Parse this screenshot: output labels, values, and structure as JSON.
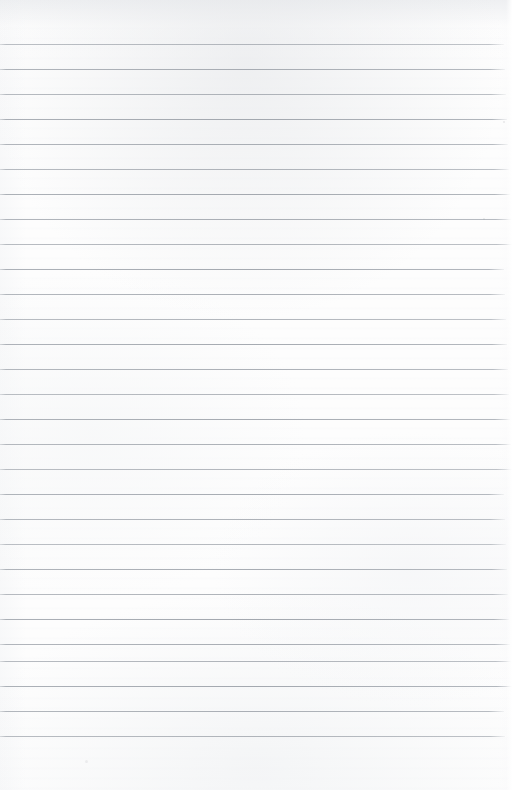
{
  "document": {
    "kind": "scanned-lined-paper",
    "title": "Blank ruled notebook page",
    "orientation": "portrait",
    "width_px": 512,
    "height_px": 790,
    "text_content": "",
    "handwriting_present": "none",
    "printed_text_present": "none"
  },
  "paper": {
    "background_color": "#fdfdfd",
    "edge_tint_color": "#e8eaed",
    "texture": "subtle scan shading, uneven illumination near top edge"
  },
  "ruling": {
    "line_color": "#a2a7ae",
    "line_thickness_px": 1,
    "line_spacing_px": 25,
    "first_line_y_px": 44,
    "last_line_y_px": 736,
    "line_count": 29,
    "left_inset_px": 0,
    "right_end_px": 508,
    "margin_rule_present": "none",
    "top_margin_px": 44,
    "bottom_margin_px": 54,
    "line_y_positions": [
      44,
      69,
      94,
      119,
      144,
      169,
      194,
      219,
      244,
      269,
      294,
      319,
      344,
      369,
      394,
      419,
      444,
      469,
      494,
      519,
      544,
      569,
      594,
      619,
      644,
      661,
      686,
      711,
      736
    ]
  },
  "artifacts": {
    "specks": [
      {
        "x": 503,
        "y": 121,
        "size": 2,
        "opacity": 0.45
      },
      {
        "x": 483,
        "y": 218,
        "size": 2,
        "opacity": 0.4
      },
      {
        "x": 85,
        "y": 760,
        "size": 3,
        "opacity": 0.3
      }
    ]
  }
}
